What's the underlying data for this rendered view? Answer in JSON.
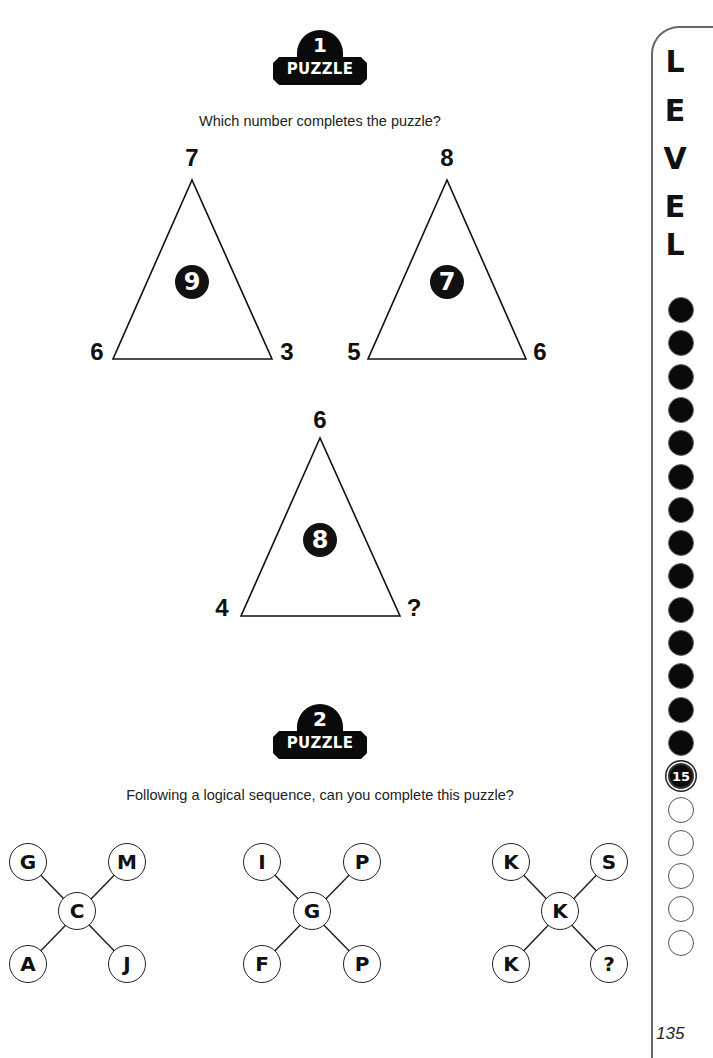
{
  "puzzles": [
    {
      "number": "1",
      "label": "PUZZLE",
      "question": "Which number completes the puzzle?",
      "triangles": [
        {
          "top": "7",
          "left": "6",
          "right": "3",
          "center": "9"
        },
        {
          "top": "8",
          "left": "5",
          "right": "6",
          "center": "7"
        },
        {
          "top": "6",
          "left": "4",
          "right": "?",
          "center": "8"
        }
      ]
    },
    {
      "number": "2",
      "label": "PUZZLE",
      "question": "Following a logical sequence, can you complete this puzzle?",
      "crosses": [
        {
          "top_left": "G",
          "top_right": "M",
          "center": "C",
          "bottom_left": "A",
          "bottom_right": "J"
        },
        {
          "top_left": "I",
          "top_right": "P",
          "center": "G",
          "bottom_left": "F",
          "bottom_right": "P"
        },
        {
          "top_left": "K",
          "top_right": "S",
          "center": "K",
          "bottom_left": "K",
          "bottom_right": "?"
        }
      ]
    }
  ],
  "level": {
    "letters": [
      "L",
      "E",
      "V",
      "E",
      "L"
    ],
    "current": "15",
    "filled_count": 14,
    "empty_count": 5
  },
  "page_number": "135"
}
